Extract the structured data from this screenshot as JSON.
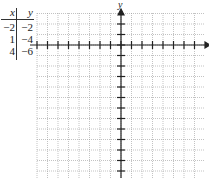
{
  "table": {
    "headers": {
      "x": "x",
      "y": "y"
    },
    "rows": [
      {
        "x": "−2",
        "y": "−2"
      },
      {
        "x": "1",
        "y": "−4"
      },
      {
        "x": "4",
        "y": "−6"
      }
    ]
  },
  "graph": {
    "y_axis_label": "y",
    "x_axis_label": "x",
    "grid_color": "#9a9a9a",
    "axis_color": "#222222"
  }
}
